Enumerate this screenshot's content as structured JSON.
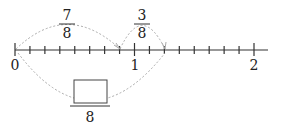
{
  "diagram": {
    "type": "number-line",
    "axis": {
      "min": 0,
      "max": 2,
      "subdivisions_per_unit": 8,
      "labels": [
        {
          "value": 0,
          "text": "0"
        },
        {
          "value": 1,
          "text": "1"
        },
        {
          "value": 2,
          "text": "2"
        }
      ]
    },
    "top_arcs": [
      {
        "from": 0,
        "to": 0.875,
        "numerator": "7",
        "denominator": "8"
      },
      {
        "from": 0.875,
        "to": 1.25,
        "numerator": "3",
        "denominator": "8"
      }
    ],
    "bottom_arc": {
      "from": 0,
      "to": 1.25,
      "numerator": "",
      "denominator": "8",
      "numerator_is_blank_box": true
    },
    "colors": {
      "axis": "#333333",
      "arc": "#aaaaaa"
    }
  }
}
